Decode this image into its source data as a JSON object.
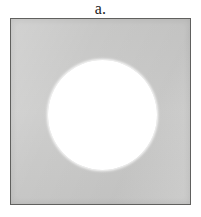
{
  "figure": {
    "caption": "a.",
    "panel": {
      "label": "grayscale micrograph panel",
      "shape_name": "bright circular disc",
      "background_color": "#cacac9",
      "disc_color": "#ffffff",
      "border_color": "#60605e",
      "page_background": "#ffffff"
    }
  }
}
